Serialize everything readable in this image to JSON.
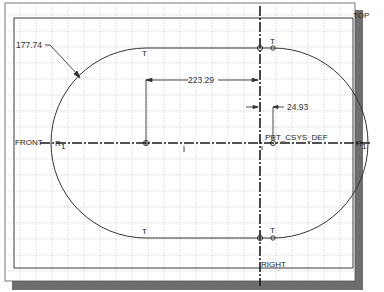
{
  "sketch": {
    "colors": {
      "background": "#ffffff",
      "grid": "#b8b8b8",
      "frame": "#444444",
      "geometry": "#333333",
      "centerline": "#1a1a1a",
      "shadow": "#6e6e6e"
    },
    "datum_labels": {
      "top": "TOP",
      "front": "FRONT",
      "right": "RIGHT",
      "csys": "PRT_CSYS_DEF"
    },
    "dimensions": {
      "radius": "177.74",
      "center_distance": "223.29",
      "offset": "24.93"
    },
    "constraint_marks": {
      "tangent_top_left": "T",
      "tangent_top_right": "T",
      "tangent_bottom_left": "T",
      "tangent_bottom_right": "T",
      "radius_left": "R",
      "radius_left_sub": "1",
      "radius_right": "R",
      "radius_right_sub": "1"
    }
  }
}
